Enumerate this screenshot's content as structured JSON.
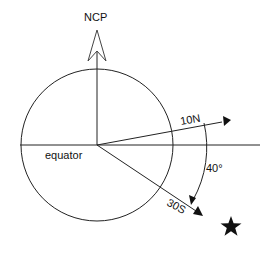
{
  "diagram": {
    "title_label": "NCP",
    "equator_label": "equator",
    "ray_upper_label": "10N",
    "ray_lower_label": "30S",
    "angle_label": "40°",
    "star": "star-icon",
    "colors": {
      "stroke": "#111111",
      "background": "#ffffff"
    }
  }
}
